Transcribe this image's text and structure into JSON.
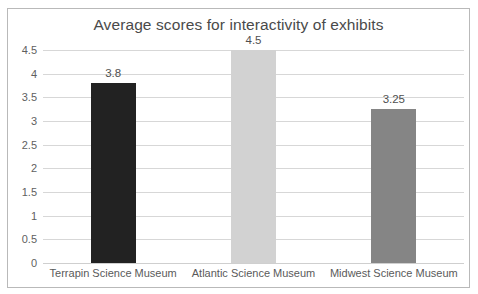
{
  "chart_data": {
    "type": "bar",
    "title": "Average scores for interactivity of exhibits",
    "xlabel": "",
    "ylabel": "",
    "categories": [
      "Terrapin Science Museum",
      "Atlantic Science Museum",
      "Midwest Science Museum"
    ],
    "values": [
      3.8,
      4.5,
      3.25
    ],
    "value_labels": [
      "3.8",
      "4.5",
      "3.25"
    ],
    "bar_colors": [
      "#222222",
      "#d2d2d2",
      "#858585"
    ],
    "ylim": [
      0,
      4.5
    ],
    "yticks": [
      0,
      0.5,
      1,
      1.5,
      2,
      2.5,
      3,
      3.5,
      4,
      4.5
    ],
    "ytick_labels": [
      "0",
      "0.5",
      "1",
      "1.5",
      "2",
      "2.5",
      "3",
      "3.5",
      "4",
      "4.5"
    ],
    "grid": true,
    "legend": false,
    "legend_position": "none"
  },
  "colors": {
    "border": "#b9b9b9",
    "gridline": "#d7d7d7",
    "title_text": "#4a4a4a",
    "tick_text": "#5f5f5f",
    "background": "#ffffff"
  }
}
